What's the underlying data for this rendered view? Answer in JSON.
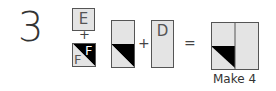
{
  "step_number": "3",
  "pieces": {
    "top_square": {
      "label": "E",
      "color": "#e4e4e4"
    },
    "bottom_square": {
      "labels": [
        "F",
        "F"
      ],
      "dark_color": "#000000",
      "light_color": "#e4e4e4"
    },
    "plus1": "+",
    "tall_rect": {
      "label": "",
      "dark_color": "#000000"
    },
    "plus2": "+",
    "d_rect": {
      "label": "D"
    },
    "equals": "=",
    "result": {
      "caption": "Make 4"
    }
  }
}
